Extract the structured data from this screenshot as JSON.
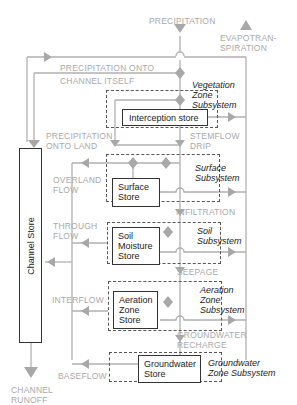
{
  "colors": {
    "flow": "#b0b0b0",
    "diamond": "#a8a8a8",
    "line_dark": "#333333",
    "text_flow": "#a9a9a9",
    "text_dark": "#222222"
  },
  "inputs": {
    "precipitation": "PRECIPITATION",
    "evapotranspiration_1": "EVAPOTRAN-",
    "evapotranspiration_2": "SPIRATION"
  },
  "flows": {
    "onto_channel_1": "PRECIPITATION ONTO",
    "onto_channel_2": "CHANNEL ITSELF",
    "onto_land_1": "PRECIPITATION",
    "onto_land_2": "ONTO LAND",
    "stemflow_1": "STEMFLOW",
    "stemflow_2": "DRIP",
    "overland_1": "OVERLAND",
    "overland_2": "FLOW",
    "infiltration": "INFILTRATION",
    "through_1": "THROUGH",
    "through_2": "FLOW",
    "seepage": "SEEPAGE",
    "interflow": "INTERFLOW",
    "gw_recharge_1": "GROUNDWATER",
    "gw_recharge_2": "RECHARGE",
    "baseflow": "BASEFLOW",
    "runoff_1": "CHANNEL",
    "runoff_2": "RUNOFF"
  },
  "subsystems": {
    "vegetation": [
      "Vegetation",
      "Zone",
      "Subsystem"
    ],
    "surface": [
      "Surface",
      "Subsystem"
    ],
    "soil": [
      "Soil",
      "Subsystem"
    ],
    "aeration": [
      "Aeration",
      "Zone",
      "Subsystem"
    ],
    "groundwater": [
      "Groundwater",
      "Zone Subsystem"
    ]
  },
  "stores": {
    "interception": "Interception store",
    "surface": [
      "Surface",
      "Store"
    ],
    "soil": [
      "Soil",
      "Moisture",
      "Store"
    ],
    "aeration": [
      "Aeration",
      "Zone",
      "Store"
    ],
    "groundwater": [
      "Groundwater",
      "Store"
    ],
    "channel": "Channel Store"
  }
}
